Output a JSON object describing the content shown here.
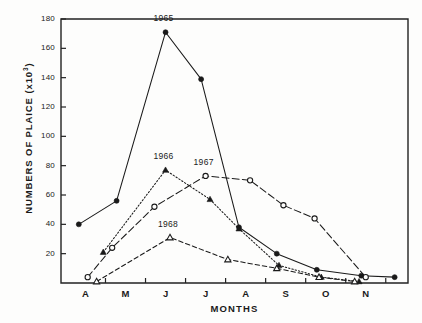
{
  "chart_data": {
    "type": "line",
    "title": "",
    "xlabel": "MONTHS",
    "ylabel": "NUMBERS OF PLAICE (x10",
    "ylabel_exponent": "3",
    "ylabel_suffix": ")",
    "categories": [
      "A",
      "M",
      "J",
      "J",
      "A",
      "S",
      "O",
      "N"
    ],
    "category_names": [
      "April",
      "May",
      "June",
      "July",
      "August",
      "September",
      "October",
      "November"
    ],
    "ylim": [
      0,
      180
    ],
    "yticks": [
      0,
      20,
      40,
      60,
      80,
      100,
      120,
      140,
      160,
      180
    ],
    "ytick_labels": [
      "",
      "20",
      "40",
      "60",
      "80",
      "100",
      "120",
      "140",
      "160",
      "180"
    ],
    "xlim": [
      3.6,
      11.4
    ],
    "grid": false,
    "legend": "inline-annotations",
    "series": [
      {
        "name": "1965",
        "label": "1965",
        "marker": "filled-circle",
        "line": "solid",
        "color": "#1a1a1a",
        "x": [
          4.0,
          4.85,
          5.95,
          6.75,
          7.6,
          8.45,
          9.35,
          10.35,
          11.1
        ],
        "values": [
          40,
          56,
          171,
          139,
          38,
          20,
          9,
          5,
          4
        ]
      },
      {
        "name": "1966",
        "label": "1966",
        "marker": "filled-triangle",
        "line": "dotted",
        "color": "#1a1a1a",
        "x": [
          4.55,
          5.95,
          6.95,
          7.6,
          8.5,
          9.45,
          10.3
        ],
        "values": [
          21,
          77,
          57,
          37,
          12,
          4,
          1
        ]
      },
      {
        "name": "1967",
        "label": "1967",
        "marker": "open-circle",
        "line": "long-dash",
        "color": "#1a1a1a",
        "x": [
          4.2,
          4.75,
          5.7,
          6.85,
          7.85,
          8.6,
          9.3,
          10.45
        ],
        "values": [
          4,
          24,
          52,
          73,
          70,
          53,
          44,
          4
        ]
      },
      {
        "name": "1968",
        "label": "1968",
        "marker": "open-triangle",
        "line": "dash",
        "color": "#1a1a1a",
        "x": [
          4.4,
          6.05,
          7.35,
          8.45,
          9.4,
          10.2
        ],
        "values": [
          1,
          31,
          16,
          10,
          4,
          1
        ]
      }
    ],
    "annotations": [
      {
        "text": "1965",
        "x": 5.95,
        "y": 171,
        "dx": 0,
        "dy": -13
      },
      {
        "text": "1966",
        "x": 5.95,
        "y": 77,
        "dx": 0,
        "dy": -13
      },
      {
        "text": "1967",
        "x": 6.85,
        "y": 73,
        "dx": 0,
        "dy": -13
      },
      {
        "text": "1968",
        "x": 6.05,
        "y": 31,
        "dx": 0,
        "dy": -13
      }
    ]
  }
}
